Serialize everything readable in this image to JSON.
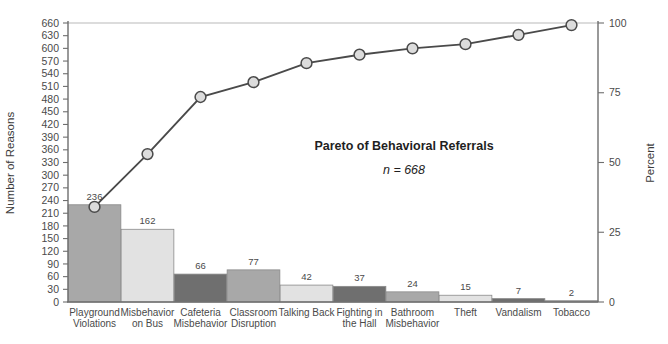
{
  "chart_data": {
    "type": "bar",
    "title": "Pareto of Behavioral Referrals",
    "subtitle": "n = 668",
    "xlabel": "",
    "ylabel": "Number of Reasons",
    "y2label": "Percent",
    "ylim": [
      0,
      660
    ],
    "y2lim": [
      0,
      100
    ],
    "grid": false,
    "legend": "none",
    "categories": [
      "Playground Violations",
      "Misbehavior on Bus",
      "Cafeteria Misbehavior",
      "Classroom Disruption",
      "Talking Back",
      "Fighting in the Hall",
      "Bathroom Misbehavior",
      "Theft",
      "Vandalism",
      "Tobacco"
    ],
    "category_lines": [
      [
        "Playground",
        "Violations"
      ],
      [
        "Misbehavior",
        "on Bus"
      ],
      [
        "Cafeteria",
        "Misbehavior"
      ],
      [
        "Classroom",
        "Disruption"
      ],
      [
        "Talking Back",
        ""
      ],
      [
        "Fighting in",
        "the Hall"
      ],
      [
        "Bathroom",
        "Misbehavior"
      ],
      [
        "Theft",
        ""
      ],
      [
        "Vandalism",
        ""
      ],
      [
        "Tobacco",
        ""
      ]
    ],
    "values": [
      236,
      162,
      66,
      77,
      42,
      37,
      24,
      15,
      7,
      2
    ],
    "value_labels": [
      "236",
      "162",
      "66",
      "77",
      "42",
      "37",
      "24",
      "15",
      "7",
      "2"
    ],
    "bar_plot_heights": [
      230,
      172,
      66,
      76,
      40,
      37,
      24,
      16,
      8,
      3
    ],
    "cumulative_counts": [
      236,
      398,
      464,
      541,
      583,
      620,
      644,
      659,
      666,
      668
    ],
    "cumulative_percent": [
      35.3,
      59.6,
      69.5,
      81.0,
      87.3,
      92.8,
      96.4,
      98.7,
      99.7,
      100.0
    ],
    "line_plot_counts": [
      225,
      350,
      485,
      520,
      565,
      585,
      600,
      610,
      632,
      655
    ],
    "y_ticks": [
      0,
      30,
      60,
      90,
      120,
      150,
      180,
      210,
      240,
      270,
      300,
      330,
      360,
      390,
      420,
      450,
      480,
      510,
      540,
      570,
      600,
      630,
      660
    ],
    "y2_ticks": [
      0,
      25,
      50,
      75,
      100
    ],
    "bar_colors": [
      "#a8a8a8",
      "#e2e2e2",
      "#6f6f6f",
      "#a8a8a8",
      "#e2e2e2",
      "#6f6f6f",
      "#a8a8a8",
      "#e2e2e2",
      "#6f6f6f",
      "#a8a8a8"
    ],
    "line_color": "#4a4a4a",
    "marker_fill": "#dcdcdc",
    "marker_stroke": "#4a4a4a",
    "axis_color": "#6e6e6e",
    "gridline_color": "#b9b9b9"
  }
}
